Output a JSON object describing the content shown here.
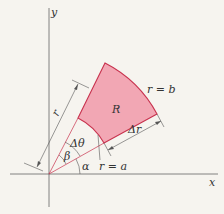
{
  "diagram": {
    "axes": {
      "x_label": "x",
      "y_label": "y"
    },
    "region_label": "R",
    "labels": {
      "outer_arc": "r = b",
      "inner_arc": "r = a",
      "delta_r": "Δr",
      "delta_theta": "Δθ",
      "alpha": "α",
      "beta": "β",
      "radius": "r"
    },
    "colors": {
      "region_fill": "#f2a7b4",
      "region_stroke": "#c8324e",
      "line": "#555555",
      "background": "#f6f4ef"
    }
  }
}
